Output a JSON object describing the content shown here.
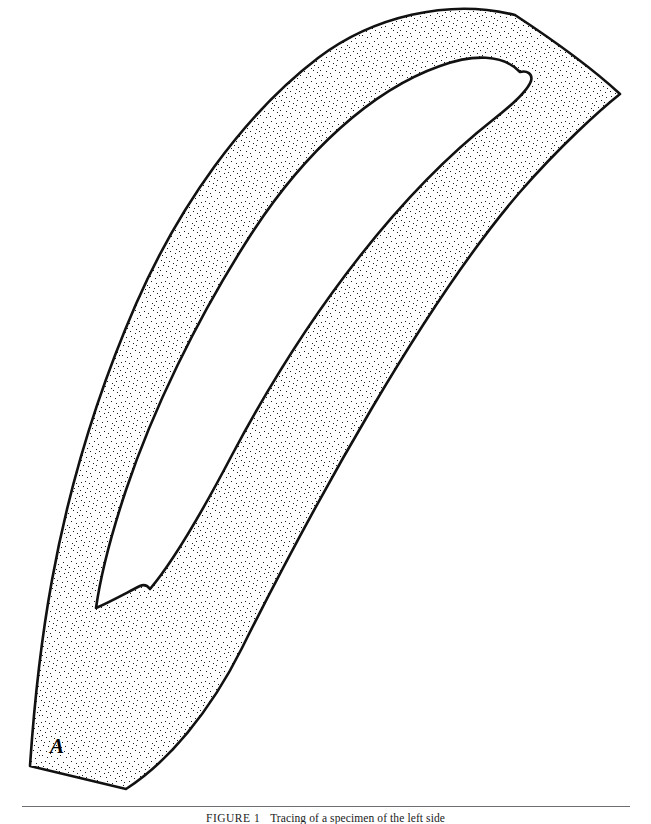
{
  "page": {
    "background_color": "#ffffff",
    "width": 651,
    "height": 822
  },
  "figure": {
    "kind": "line-drawing-tracing",
    "outline_color": "#111111",
    "outline_width": 2.6,
    "fill_style": "stipple",
    "stipple_dot_color": "#1c1c1c",
    "stipple_background": "#ffffff",
    "stipple_density": "fine",
    "void_fill": "#ffffff",
    "labels": [
      {
        "id": "A",
        "text": "A",
        "x": 57,
        "y": 748,
        "style": "bold-italic-serif"
      }
    ]
  },
  "caption": {
    "rule_color": "#6e6e72",
    "number_label": "FIGURE 1",
    "body_text": "Tracing of a specimen of the left side",
    "full_text": "FIGURE 1   Tracing of a specimen of the left side"
  }
}
